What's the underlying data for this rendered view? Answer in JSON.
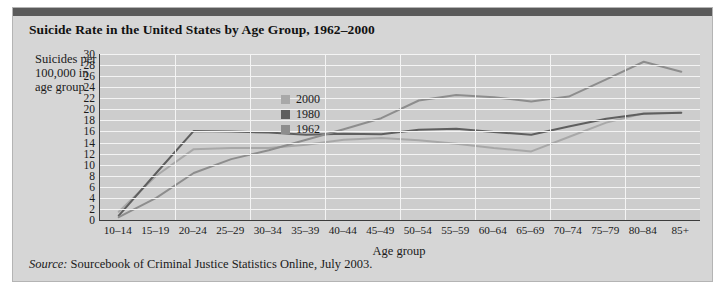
{
  "figure": {
    "title": "Suicide Rate in the United States by Age Group, 1962–2000",
    "source_word": "Source:",
    "source_text": " Sourcebook of Criminal Justice Statistics Online, July 2003."
  },
  "colors": {
    "panel_background": "#d6d6d6",
    "plot_background": "#cdcdcd",
    "gridline": "#f4f4f4",
    "axis": "#3c3c3c",
    "top_bar": "#5a5a5a",
    "series_2000": "#a8a8a8",
    "series_1980": "#5f5f5f",
    "series_1962": "#8d8d8d"
  },
  "chart_data": {
    "type": "line",
    "title": "Suicide Rate in the United States by Age Group, 1962–2000",
    "xlabel": "Age group",
    "ylabel": "Suicides per 100,000 in age group",
    "ylim": [
      0,
      30
    ],
    "yticks": [
      0,
      2,
      4,
      6,
      8,
      10,
      12,
      14,
      16,
      18,
      20,
      22,
      24,
      26,
      28,
      30
    ],
    "grid": true,
    "legend_position": "inside-upper-center",
    "categories": [
      "10–14",
      "15–19",
      "20–24",
      "25–29",
      "30–34",
      "35–39",
      "40–44",
      "45–49",
      "50–54",
      "55–59",
      "60–64",
      "65–69",
      "70–74",
      "75–79",
      "80–84",
      "85+"
    ],
    "series": [
      {
        "name": "2000",
        "color": "#a8a8a8",
        "values": [
          1.5,
          8.0,
          12.8,
          13.0,
          13.0,
          13.6,
          14.5,
          14.8,
          14.4,
          13.8,
          13.0,
          12.4,
          15.0,
          17.6,
          19.3,
          19.4
        ]
      },
      {
        "name": "1980",
        "color": "#5f5f5f",
        "values": [
          0.8,
          8.5,
          16.1,
          16.0,
          15.8,
          15.4,
          15.6,
          15.5,
          16.3,
          16.5,
          15.9,
          15.4,
          16.9,
          18.3,
          19.2,
          19.4
        ]
      },
      {
        "name": "1962",
        "color": "#8d8d8d",
        "values": [
          0.5,
          4.0,
          8.5,
          11.0,
          12.6,
          14.5,
          16.4,
          18.4,
          21.6,
          22.6,
          22.2,
          21.4,
          22.3,
          25.4,
          28.6,
          26.8
        ]
      }
    ]
  }
}
